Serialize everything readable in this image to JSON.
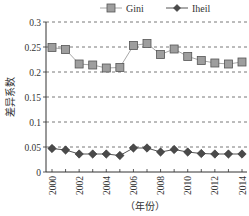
{
  "chart_data": {
    "type": "line",
    "title": "",
    "xlabel": "（年份）",
    "ylabel": "差异系数",
    "x": [
      2000,
      2001,
      2002,
      2003,
      2004,
      2005,
      2006,
      2007,
      2008,
      2009,
      2010,
      2011,
      2012,
      2013,
      2014
    ],
    "x_tick_labels": [
      "2000",
      "2002",
      "2004",
      "2006",
      "2008",
      "2010",
      "2012",
      "2014"
    ],
    "y_tick_labels": [
      "0",
      "0.05",
      "0.1",
      "0.15",
      "0.2",
      "0.25",
      "0.3"
    ],
    "ylim": [
      0,
      0.3
    ],
    "grid": "horizontal dashed",
    "legend_position": "top",
    "series": [
      {
        "name": "Gini",
        "marker": "square",
        "marker_color": "#9e9e9e",
        "line_color": "#a8a8a8",
        "values": [
          0.249,
          0.245,
          0.216,
          0.214,
          0.208,
          0.209,
          0.253,
          0.257,
          0.235,
          0.246,
          0.231,
          0.223,
          0.218,
          0.216,
          0.22
        ]
      },
      {
        "name": "Iheil",
        "marker": "diamond",
        "marker_color": "#4a4a4a",
        "line_color": "#555555",
        "values": [
          0.047,
          0.044,
          0.036,
          0.036,
          0.036,
          0.033,
          0.048,
          0.048,
          0.04,
          0.045,
          0.04,
          0.037,
          0.036,
          0.036,
          0.036
        ]
      }
    ]
  }
}
